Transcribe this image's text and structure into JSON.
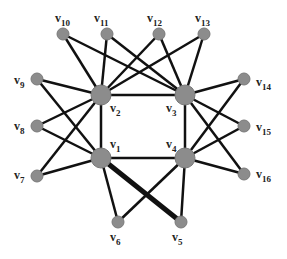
{
  "diagram": {
    "type": "graph",
    "colors": {
      "edge": "#111111",
      "node_fill": "#8c8c8c",
      "node_stroke": "#7a7a7a",
      "label": "#222222"
    },
    "nodes": [
      {
        "id": "v1",
        "label": "v",
        "sub": "1",
        "x": 101,
        "y": 158,
        "r": 10,
        "lx": 110,
        "ly": 148
      },
      {
        "id": "v2",
        "label": "v",
        "sub": "2",
        "x": 101,
        "y": 95,
        "r": 10,
        "lx": 110,
        "ly": 112
      },
      {
        "id": "v3",
        "label": "v",
        "sub": "3",
        "x": 185,
        "y": 95,
        "r": 10,
        "lx": 166,
        "ly": 112
      },
      {
        "id": "v4",
        "label": "v",
        "sub": "4",
        "x": 185,
        "y": 158,
        "r": 10,
        "lx": 166,
        "ly": 148
      },
      {
        "id": "v5",
        "label": "v",
        "sub": "5",
        "x": 181,
        "y": 222,
        "r": 6,
        "lx": 172,
        "ly": 241
      },
      {
        "id": "v6",
        "label": "v",
        "sub": "6",
        "x": 118,
        "y": 222,
        "r": 6,
        "lx": 110,
        "ly": 241
      },
      {
        "id": "v7",
        "label": "v",
        "sub": "7",
        "x": 37,
        "y": 176,
        "r": 6,
        "lx": 14,
        "ly": 179
      },
      {
        "id": "v8",
        "label": "v",
        "sub": "8",
        "x": 37,
        "y": 126,
        "r": 6,
        "lx": 14,
        "ly": 130
      },
      {
        "id": "v9",
        "label": "v",
        "sub": "9",
        "x": 37,
        "y": 79,
        "r": 6,
        "lx": 14,
        "ly": 84
      },
      {
        "id": "v10",
        "label": "v",
        "sub": "10",
        "x": 63,
        "y": 34,
        "r": 6,
        "lx": 55,
        "ly": 22
      },
      {
        "id": "v11",
        "label": "v",
        "sub": "11",
        "x": 107,
        "y": 34,
        "r": 6,
        "lx": 94,
        "ly": 22
      },
      {
        "id": "v12",
        "label": "v",
        "sub": "12",
        "x": 159,
        "y": 34,
        "r": 6,
        "lx": 147,
        "ly": 22
      },
      {
        "id": "v13",
        "label": "v",
        "sub": "13",
        "x": 204,
        "y": 34,
        "r": 6,
        "lx": 195,
        "ly": 22
      },
      {
        "id": "v14",
        "label": "v",
        "sub": "14",
        "x": 244,
        "y": 79,
        "r": 6,
        "lx": 256,
        "ly": 86
      },
      {
        "id": "v15",
        "label": "v",
        "sub": "15",
        "x": 244,
        "y": 126,
        "r": 6,
        "lx": 256,
        "ly": 131
      },
      {
        "id": "v16",
        "label": "v",
        "sub": "16",
        "x": 244,
        "y": 174,
        "r": 6,
        "lx": 256,
        "ly": 178
      }
    ],
    "edges": [
      {
        "from": "v1",
        "to": "v2",
        "w": 2.5
      },
      {
        "from": "v2",
        "to": "v3",
        "w": 2.5
      },
      {
        "from": "v3",
        "to": "v4",
        "w": 2.5
      },
      {
        "from": "v1",
        "to": "v4",
        "w": 2.5
      },
      {
        "from": "v10",
        "to": "v2",
        "w": 2.5
      },
      {
        "from": "v10",
        "to": "v3",
        "w": 2.5
      },
      {
        "from": "v11",
        "to": "v2",
        "w": 2.5
      },
      {
        "from": "v11",
        "to": "v3",
        "w": 2.5
      },
      {
        "from": "v12",
        "to": "v2",
        "w": 2.5
      },
      {
        "from": "v12",
        "to": "v3",
        "w": 2.5
      },
      {
        "from": "v13",
        "to": "v2",
        "w": 2.5
      },
      {
        "from": "v13",
        "to": "v3",
        "w": 2.5
      },
      {
        "from": "v9",
        "to": "v2",
        "w": 2.5
      },
      {
        "from": "v9",
        "to": "v1",
        "w": 2.5
      },
      {
        "from": "v8",
        "to": "v2",
        "w": 2.5
      },
      {
        "from": "v8",
        "to": "v1",
        "w": 2.5
      },
      {
        "from": "v7",
        "to": "v2",
        "w": 2.5
      },
      {
        "from": "v7",
        "to": "v1",
        "w": 2.5
      },
      {
        "from": "v14",
        "to": "v3",
        "w": 2.5
      },
      {
        "from": "v14",
        "to": "v4",
        "w": 2.5
      },
      {
        "from": "v15",
        "to": "v3",
        "w": 2.5
      },
      {
        "from": "v15",
        "to": "v4",
        "w": 2.5
      },
      {
        "from": "v16",
        "to": "v3",
        "w": 2.5
      },
      {
        "from": "v16",
        "to": "v4",
        "w": 2.5
      },
      {
        "from": "v1",
        "to": "v6",
        "w": 2.5
      },
      {
        "from": "v1",
        "to": "v5",
        "w": 5
      },
      {
        "from": "v4",
        "to": "v6",
        "w": 2.5
      },
      {
        "from": "v4",
        "to": "v5",
        "w": 2.5
      }
    ]
  }
}
